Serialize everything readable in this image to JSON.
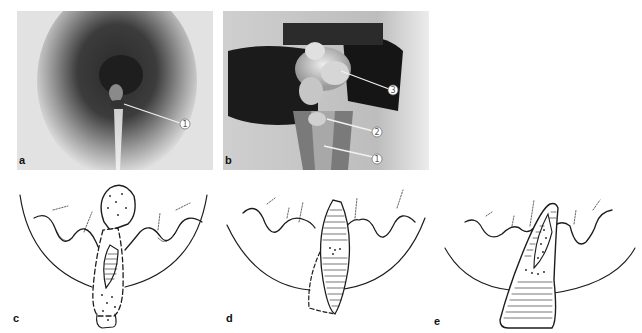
{
  "figure": {
    "panels": [
      {
        "id": "a",
        "label": "a",
        "type": "photograph",
        "callouts": [
          {
            "number": "①",
            "value": "1"
          }
        ]
      },
      {
        "id": "b",
        "label": "b",
        "type": "photograph",
        "callouts": [
          {
            "number": "③",
            "value": "3"
          },
          {
            "number": "②",
            "value": "2"
          },
          {
            "number": "①",
            "value": "1"
          }
        ]
      },
      {
        "id": "c",
        "label": "c",
        "type": "line-drawing"
      },
      {
        "id": "d",
        "label": "d",
        "type": "line-drawing"
      },
      {
        "id": "e",
        "label": "e",
        "type": "line-drawing"
      }
    ]
  },
  "colors": {
    "background": "#ffffff",
    "photo_light": "#e6e6e6",
    "photo_dark": "#1a1a1a",
    "ink": "#1c1c1c",
    "callout_line": "#f2f2f2"
  }
}
